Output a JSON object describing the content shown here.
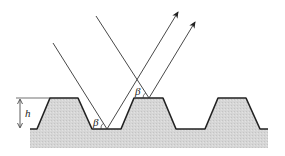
{
  "diagram": {
    "labels": {
      "height": "h",
      "angle_left": "β",
      "angle_right": "β"
    },
    "colors": {
      "substrate_fill": "#d4d4d4",
      "profile_stroke": "#222222",
      "ray_stroke": "#333333"
    }
  }
}
